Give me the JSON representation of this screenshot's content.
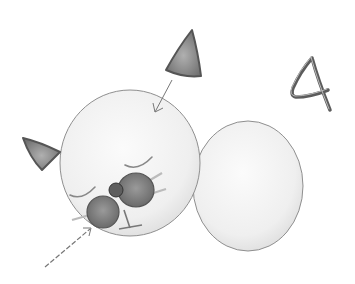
{
  "illustration": {
    "subject": "step 4 of drawing a sleeping cat: attach ears and nose/muzzle",
    "step_number": "4",
    "colors": {
      "background": "#ffffff",
      "body_fill": "#f4f4f4",
      "outline": "#8a8a8a",
      "ear_fill": "#8c8c8c",
      "muzzle_fill": "#7e7e7e",
      "nose_fill": "#5e5e5e",
      "arrow": "#777777",
      "step_number_color": "#555555"
    }
  }
}
